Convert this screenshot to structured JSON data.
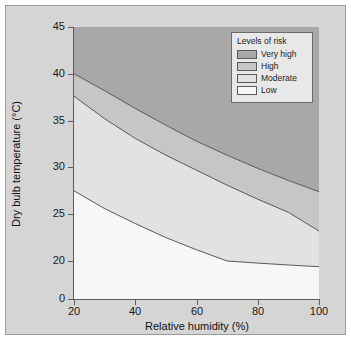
{
  "chart_data": {
    "type": "area",
    "title": "",
    "xlabel": "Relative humidity (%)",
    "ylabel": "Dry bulb temperature (°C)",
    "xlim": [
      20,
      100
    ],
    "ylim": [
      0,
      45
    ],
    "xticks": [
      "20",
      "40",
      "60",
      "80",
      "100"
    ],
    "xtick_values": [
      20,
      40,
      60,
      80,
      100
    ],
    "yticks": [
      "0",
      "20",
      "25",
      "30",
      "35",
      "40",
      "45"
    ],
    "ytick_values": [
      0,
      20,
      25,
      30,
      35,
      40,
      45
    ],
    "grid": false,
    "legend": {
      "title": "Levels of risk",
      "position": "upper right",
      "entries": [
        {
          "label": "Very high",
          "color": "#a8a8a8"
        },
        {
          "label": "High",
          "color": "#c6c6c6"
        },
        {
          "label": "Moderate",
          "color": "#e2e2e2"
        },
        {
          "label": "Low",
          "color": "#f7f7f7"
        }
      ]
    },
    "x": [
      20,
      30,
      40,
      50,
      60,
      70,
      80,
      90,
      100
    ],
    "boundaries": [
      {
        "name": "low-moderate",
        "label": "Low / Moderate boundary",
        "values": [
          27.5,
          25.6,
          24.0,
          22.5,
          21.2,
          20.0,
          18.9,
          17.9,
          17.0
        ]
      },
      {
        "name": "moderate-high",
        "label": "Moderate / High boundary",
        "values": [
          37.6,
          35.2,
          33.1,
          31.3,
          29.7,
          28.1,
          26.6,
          25.2,
          23.2
        ]
      },
      {
        "name": "high-veryhigh",
        "label": "High / Very high boundary",
        "values": [
          40.0,
          38.2,
          36.3,
          34.5,
          32.8,
          31.3,
          29.9,
          28.6,
          27.4
        ]
      }
    ],
    "bands": [
      {
        "name": "Low",
        "color": "#f7f7f7",
        "from": "y-min",
        "to": "low-moderate"
      },
      {
        "name": "Moderate",
        "color": "#e2e2e2",
        "from": "low-moderate",
        "to": "moderate-high"
      },
      {
        "name": "High",
        "color": "#c6c6c6",
        "from": "moderate-high",
        "to": "high-veryhigh"
      },
      {
        "name": "Very high",
        "color": "#a8a8a8",
        "from": "high-veryhigh",
        "to": "y-max"
      }
    ]
  },
  "figure": {
    "background_color": "#d5d5d5",
    "border_color": "#9a9a9a",
    "axis_color": "#5d5d5d",
    "line_color": "#5a5a5a"
  }
}
